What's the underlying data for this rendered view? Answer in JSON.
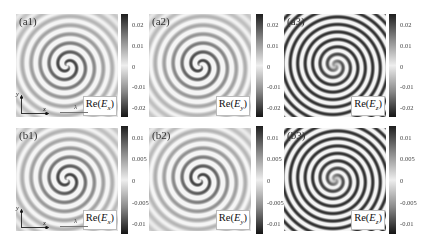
{
  "figure": {
    "panels": [
      {
        "id": "a1",
        "label": "(a1)",
        "field": "Re",
        "comp": "x",
        "x": 16,
        "y": 14,
        "style": "a",
        "cbar_x": 121,
        "cbar": {
          "ticks": [
            "0.02",
            "0.01",
            "0",
            "-0.01",
            "-0.02"
          ],
          "top": 14,
          "height": 103
        },
        "axes": true
      },
      {
        "id": "a2",
        "label": "(a2)",
        "field": "Re",
        "comp": "y",
        "x": 149,
        "y": 14,
        "style": "a",
        "cbar_x": 256,
        "cbar": {
          "ticks": [
            "0.02",
            "0.01",
            "0",
            "-0.01",
            "-0.02"
          ],
          "top": 14,
          "height": 103
        },
        "axes": false
      },
      {
        "id": "a3",
        "label": "(a3)",
        "field": "Re",
        "comp": "z",
        "x": 284,
        "y": 14,
        "style": "c",
        "cbar_x": 389,
        "cbar": {
          "ticks": [
            "0.02",
            "0.01",
            "0",
            "-0.01",
            "-0.02"
          ],
          "top": 14,
          "height": 103
        },
        "axes": false
      },
      {
        "id": "b1",
        "label": "(b1)",
        "field": "Re",
        "comp": "x",
        "x": 16,
        "y": 128,
        "style": "b",
        "cbar_x": 121,
        "cbar": {
          "ticks": [
            "0.01",
            "0.005",
            "0",
            "-0.005",
            "-0.01"
          ],
          "top": 126,
          "height": 108
        },
        "axes": true
      },
      {
        "id": "b2",
        "label": "(b2)",
        "field": "Re",
        "comp": "y",
        "x": 149,
        "y": 128,
        "style": "b",
        "cbar_x": 256,
        "cbar": {
          "ticks": [
            "0.01",
            "0.005",
            "0",
            "-0.005",
            "-0.01"
          ],
          "top": 126,
          "height": 108
        },
        "axes": false
      },
      {
        "id": "b3",
        "label": "(b3)",
        "field": "Re",
        "comp": "z",
        "x": 284,
        "y": 128,
        "style": "d",
        "cbar_x": 389,
        "cbar": {
          "ticks": [
            "0.01",
            "0.005",
            "0",
            "-0.005",
            "-0.01"
          ],
          "top": 126,
          "height": 108
        },
        "axes": false
      }
    ],
    "axes_labels": {
      "y": "y",
      "x": "x",
      "lambda": "λ"
    },
    "colormap": {
      "high": "#2b2b2b",
      "mid": "#e6e6e6",
      "low": "#1a1a1a"
    }
  }
}
